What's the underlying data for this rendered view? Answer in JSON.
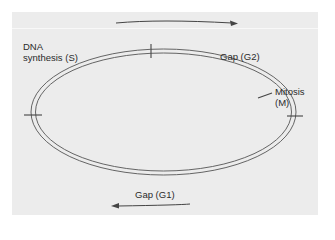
{
  "diagram": {
    "colors": {
      "background": "#ffffff",
      "panel": "#ececec",
      "line": "#555555",
      "text": "#2a2a2a"
    },
    "phases": [
      {
        "id": "S",
        "line1": "DNA",
        "line2": "synthesis (S)"
      },
      {
        "id": "G2",
        "line1": "Gap (G2)"
      },
      {
        "id": "M",
        "line1": "Mitosis",
        "line2": "(M)"
      },
      {
        "id": "G1",
        "line1": "Gap (G1)"
      }
    ],
    "arrows": [
      {
        "position": "top",
        "direction": "right"
      },
      {
        "position": "bottom",
        "direction": "left"
      }
    ]
  }
}
